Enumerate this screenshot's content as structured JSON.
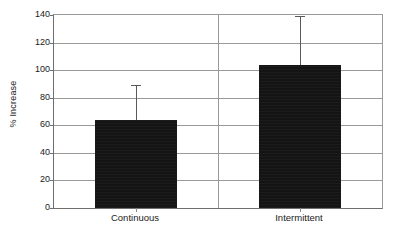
{
  "chart_data": {
    "type": "bar",
    "title": "",
    "subtitle": "",
    "xlabel": "",
    "ylabel": "% Increase",
    "categories": [
      "Continuous",
      "Intermittent"
    ],
    "values": [
      64,
      104
    ],
    "errors_upper": [
      25,
      35
    ],
    "error_cap_values": [
      89,
      139
    ],
    "ylim": [
      0,
      140
    ],
    "ytick_values": [
      0,
      20,
      40,
      60,
      80,
      100,
      120,
      140
    ],
    "ytick_labels": [
      "0",
      "20",
      "40",
      "60",
      "80",
      "100",
      "120",
      "140"
    ],
    "grid": true,
    "legend": false,
    "legend_position": "none",
    "bar_color": "#141414",
    "grid_color": "#9a9a9a",
    "axis_color": "#6e6e6e",
    "error_color": "#5a5a5a",
    "bar_width_fraction": 0.5,
    "category_divider": true
  }
}
